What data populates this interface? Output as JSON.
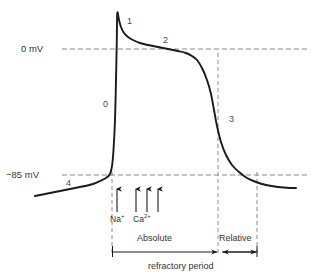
{
  "figure": {
    "axis_labels": {
      "zero_mv": "0 mV",
      "resting_mv": "−85 mV"
    },
    "phase_labels": [
      {
        "name": "phase-0",
        "text": "0",
        "x": 103,
        "y": 100
      },
      {
        "name": "phase-1",
        "text": "1",
        "x": 127,
        "y": 17
      },
      {
        "name": "phase-2",
        "text": "2",
        "x": 163,
        "y": 36
      },
      {
        "name": "phase-3",
        "text": "3",
        "x": 229,
        "y": 115
      },
      {
        "name": "phase-4",
        "text": "4",
        "x": 66,
        "y": 179
      }
    ],
    "ion_labels": [
      {
        "name": "sodium-label",
        "ion": "Na",
        "charge": "+",
        "x": 110,
        "y": 215
      },
      {
        "name": "calcium-label",
        "ion": "Ca",
        "charge": "2+",
        "x": 133,
        "y": 215
      }
    ],
    "refractory": {
      "absolute_label": "Absolute",
      "relative_label": "Relative",
      "caption": "refractory period"
    },
    "colors": {
      "curve": "#1a1a1a",
      "dashed": "#8a8a8a",
      "text": "#333333",
      "arrow": "#1a1a1a",
      "background": "#ffffff"
    }
  },
  "chart_data": {
    "type": "line",
    "xlabel": "",
    "ylabel": "Membrane potential (mV)",
    "ylim": [
      -95,
      25
    ],
    "xlim": [
      0,
      313
    ],
    "grid": false,
    "legend": "none",
    "y_tick_labels": [
      "0 mV",
      "−85 mV"
    ],
    "y_tick_values": [
      0,
      -85
    ],
    "y_tick_pixels": [
      49,
      175
    ],
    "series": [
      {
        "name": "action-potential",
        "comment": "Pixel-space polyline of the action potential trace (x,y in image coords)",
        "points": [
          [
            35,
            196
          ],
          [
            45,
            194
          ],
          [
            55,
            192
          ],
          [
            65,
            190
          ],
          [
            75,
            188
          ],
          [
            85,
            186
          ],
          [
            93,
            184
          ],
          [
            100,
            181
          ],
          [
            106,
            178
          ],
          [
            110,
            174
          ],
          [
            112,
            166
          ],
          [
            113.5,
            150
          ],
          [
            115,
            120
          ],
          [
            116,
            80
          ],
          [
            116.8,
            40
          ],
          [
            117.3,
            13
          ],
          [
            119,
            20
          ],
          [
            121,
            27
          ],
          [
            124,
            33
          ],
          [
            128,
            37
          ],
          [
            133,
            40
          ],
          [
            140,
            43
          ],
          [
            148,
            45
          ],
          [
            158,
            47
          ],
          [
            168,
            49
          ],
          [
            178,
            51
          ],
          [
            186,
            53
          ],
          [
            192,
            56
          ],
          [
            197,
            60
          ],
          [
            202,
            68
          ],
          [
            207,
            80
          ],
          [
            211,
            94
          ],
          [
            214,
            110
          ],
          [
            217,
            126
          ],
          [
            221,
            142
          ],
          [
            226,
            155
          ],
          [
            232,
            165
          ],
          [
            239,
            172
          ],
          [
            247,
            178
          ],
          [
            256,
            182
          ],
          [
            266,
            185
          ],
          [
            278,
            187
          ],
          [
            290,
            188
          ],
          [
            296,
            188
          ]
        ]
      }
    ],
    "annotations": {
      "phases": [
        {
          "label": "0",
          "meaning": "rapid depolarization"
        },
        {
          "label": "1",
          "meaning": "initial repolarization"
        },
        {
          "label": "2",
          "meaning": "plateau"
        },
        {
          "label": "3",
          "meaning": "repolarization"
        },
        {
          "label": "4",
          "meaning": "resting potential"
        }
      ],
      "ion_arrows": [
        {
          "ion": "Na+",
          "x": 117
        },
        {
          "ion": "Ca2+",
          "x": 136
        },
        {
          "ion": "Ca2+",
          "x": 147
        },
        {
          "ion": "Ca2+",
          "x": 158
        }
      ],
      "periods": [
        {
          "label": "Absolute",
          "x_start": 112,
          "x_end": 218
        },
        {
          "label": "Relative",
          "x_start": 222,
          "x_end": 257
        }
      ]
    }
  }
}
